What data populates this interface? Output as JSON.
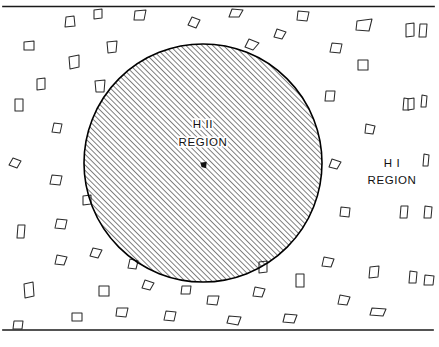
{
  "figure": {
    "type": "astronomy-schematic-diagram",
    "background_color": "#ffffff",
    "ink_color": "#111111",
    "width": 439,
    "height": 347
  },
  "labels": {
    "inner": {
      "line1": "H II",
      "line2": "REGION",
      "x": 203,
      "y_line1": 128,
      "y_line2": 146
    },
    "outer": {
      "line1": "H I",
      "line2": "REGION",
      "x": 392,
      "y_line1": 167,
      "y_line2": 184
    }
  },
  "circle": {
    "name": "hii-region-boundary",
    "cx": 203,
    "cy": 163,
    "r": 119,
    "fill_pattern": "diagonal-hatch-45deg",
    "hatch_spacing_px": 3.8,
    "stroke_color": "#000000"
  },
  "center_marker": {
    "name": "ionizing-star",
    "cx": 203.5,
    "cy": 165,
    "size": 3.2
  },
  "rules": [
    {
      "name": "top-rule",
      "x1": 3,
      "y1": 6.5,
      "x2": 434,
      "y2": 6.5
    },
    {
      "name": "bottom-rule",
      "x1": 3,
      "y1": 330,
      "x2": 433,
      "y2": 330
    }
  ],
  "clumps": {
    "count": 58,
    "description": "Small irregular hand-drawn polygon outlines representing neutral hydrogen clumps scattered through the HI region only.",
    "shapes": [
      {
        "cx": 70,
        "cy": 22,
        "pts": "-5,5 -4,-5 4,-6 5,4"
      },
      {
        "cx": 140,
        "cy": 15,
        "pts": "-6,5 -5,-4 6,-5 4,5"
      },
      {
        "cx": 194,
        "cy": 22,
        "pts": "-6,3 -2,-5 6,-2 2,6"
      },
      {
        "cx": 236,
        "cy": 13,
        "pts": "-7,4 -4,-4 7,-3 3,4"
      },
      {
        "cx": 303,
        "cy": 16,
        "pts": "-6,4 -5,-5 6,-4 4,5"
      },
      {
        "cx": 364,
        "cy": 25,
        "pts": "-8,5 -7,-4 8,-6 5,6"
      },
      {
        "cx": 410,
        "cy": 30,
        "pts": "-4,7 -4,-6 4,-7 4,6"
      },
      {
        "cx": 29,
        "cy": 46,
        "pts": "-5,4 -5,-4 5,-5 5,4"
      },
      {
        "cx": 112,
        "cy": 47,
        "pts": "-4,6 -5,-5 5,-6 4,5"
      },
      {
        "cx": 363,
        "cy": 65,
        "pts": "-5,5 -5,-5 5,-5 5,5"
      },
      {
        "cx": 74,
        "cy": 62,
        "pts": "-4,7 -5,-5 5,-7 5,5"
      },
      {
        "cx": 252,
        "cy": 44,
        "pts": "-7,3 -3,-5 7,-1 1,6"
      },
      {
        "cx": 19,
        "cy": 105,
        "pts": "-4,6 -4,-6 4,-6 4,6"
      },
      {
        "cx": 57,
        "cy": 128,
        "pts": "-5,4 -3,-5 5,-4 3,5"
      },
      {
        "cx": 100,
        "cy": 86,
        "pts": "-4,6 -5,-5 5,-6 4,6"
      },
      {
        "cx": 406,
        "cy": 104,
        "pts": "-3,6 -2,-6 4,-5 3,6"
      },
      {
        "cx": 370,
        "cy": 129,
        "pts": "-5,4 -4,-5 5,-3 3,5"
      },
      {
        "cx": 15,
        "cy": 163,
        "pts": "-6,2 -2,-5 6,-2 2,5"
      },
      {
        "cx": 56,
        "cy": 180,
        "pts": "-6,4 -4,-5 6,-4 4,5"
      },
      {
        "cx": 411,
        "cy": 104,
        "pts": "-3,6 -3,-5 3,-6 3,5"
      },
      {
        "cx": 335,
        "cy": 164,
        "pts": "-6,3 -3,-5 6,-2 2,5"
      },
      {
        "cx": 21,
        "cy": 231,
        "pts": "-4,7 -3,-6 4,-6 3,7"
      },
      {
        "cx": 61,
        "cy": 224,
        "pts": "-6,4 -4,-5 6,-4 4,5"
      },
      {
        "cx": 29,
        "cy": 290,
        "pts": "-4,8 -5,-6 4,-8 5,6"
      },
      {
        "cx": 61,
        "cy": 260,
        "pts": "-6,4 -4,-5 6,-3 3,5"
      },
      {
        "cx": 77,
        "cy": 317,
        "pts": "-5,4 -5,-4 5,-4 5,4"
      },
      {
        "cx": 345,
        "cy": 212,
        "pts": "-5,4 -4,-5 5,-4 4,5"
      },
      {
        "cx": 404,
        "cy": 212,
        "pts": "-4,6 -3,-6 4,-6 3,6"
      },
      {
        "cx": 328,
        "cy": 262,
        "pts": "-6,4 -4,-5 6,-3 3,5"
      },
      {
        "cx": 374,
        "cy": 272,
        "pts": "-5,6 -4,-5 5,-6 4,5"
      },
      {
        "cx": 413,
        "cy": 277,
        "pts": "-4,6 -3,-6 4,-5 3,6"
      },
      {
        "cx": 300,
        "cy": 280,
        "pts": "-4,7 -4,-6 4,-6 4,7"
      },
      {
        "cx": 259,
        "cy": 292,
        "pts": "-6,4 -4,-5 6,-3 3,5"
      },
      {
        "cx": 213,
        "cy": 300,
        "pts": "-6,4 -5,-4 6,-4 4,5"
      },
      {
        "cx": 148,
        "cy": 285,
        "pts": "-6,3 -3,-5 6,-2 2,5"
      },
      {
        "cx": 104,
        "cy": 291,
        "pts": "-5,5 -5,-5 5,-5 5,5"
      },
      {
        "cx": 170,
        "cy": 316,
        "pts": "-6,4 -4,-5 6,-4 4,5"
      },
      {
        "cx": 234,
        "cy": 320,
        "pts": "-7,3 -5,-4 7,-3 4,5"
      },
      {
        "cx": 290,
        "cy": 318,
        "pts": "-7,4 -5,-4 7,-3 4,5"
      },
      {
        "cx": 378,
        "cy": 312,
        "pts": "-8,3 -6,-4 8,-3 5,4"
      },
      {
        "cx": 122,
        "cy": 312,
        "pts": "-6,4 -5,-4 6,-4 4,5"
      },
      {
        "cx": 18,
        "cy": 325,
        "pts": "-5,4 -4,-4 5,-4 4,4"
      },
      {
        "cx": 330,
        "cy": 96,
        "pts": "-5,5 -4,-5 5,-5 4,5"
      },
      {
        "cx": 280,
        "cy": 34,
        "pts": "-6,3 -3,-5 6,-2 2,5"
      },
      {
        "cx": 336,
        "cy": 48,
        "pts": "-6,4 -4,-5 6,-4 4,5"
      },
      {
        "cx": 96,
        "cy": 253,
        "pts": "-6,3 -3,-5 6,-3 2,5"
      },
      {
        "cx": 133,
        "cy": 264,
        "pts": "-5,4 -3,-5 5,-3 3,5"
      },
      {
        "cx": 41,
        "cy": 84,
        "pts": "-4,6 -4,-5 4,-6 4,5"
      },
      {
        "cx": 98,
        "cy": 14,
        "pts": "-4,5 -4,-4 4,-5 4,4"
      },
      {
        "cx": 426,
        "cy": 160,
        "pts": "-3,6 -2,-6 3,-5 2,6"
      },
      {
        "cx": 423,
        "cy": 30,
        "pts": "-4,7 -3,-6 4,-6 3,7"
      },
      {
        "cx": 424,
        "cy": 101,
        "pts": "-3,6 -2,-6 3,-5 2,6"
      },
      {
        "cx": 428,
        "cy": 212,
        "pts": "-4,6 -3,-6 4,-5 3,6"
      },
      {
        "cx": 429,
        "cy": 280,
        "pts": "-5,5 -4,-5 5,-4 4,5"
      },
      {
        "cx": 344,
        "cy": 300,
        "pts": "-6,4 -4,-5 6,-3 3,5"
      },
      {
        "cx": 186,
        "cy": 290,
        "pts": "-5,4 -4,-4 5,-4 4,4"
      },
      {
        "cx": 263,
        "cy": 267,
        "pts": "-4,6 -4,-5 4,-6 4,5"
      },
      {
        "cx": 87,
        "cy": 200,
        "pts": "-4,5 -4,-4 4,-5 4,4"
      }
    ]
  }
}
